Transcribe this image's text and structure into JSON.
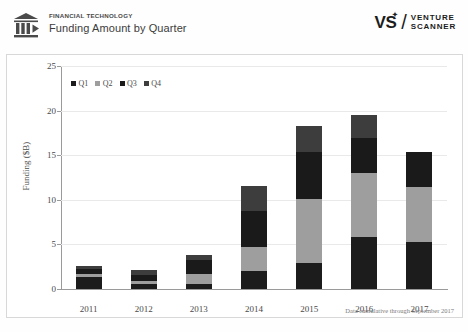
{
  "header": {
    "kicker": "FINANCIAL TECHNOLOGY",
    "title": "Funding Amount by Quarter",
    "logo_icon": "bank-columns-play-icon",
    "brand": {
      "mark": "VS",
      "star": "✦",
      "slash": "/",
      "line1": "VENTURE",
      "line2": "SCANNER"
    }
  },
  "footnote": "Data cumulative through September 2017",
  "chart_data": {
    "type": "bar",
    "stacked": true,
    "title": "Funding Amount by Quarter",
    "xlabel": "",
    "ylabel": "Funding ($B)",
    "ylim": [
      0,
      25
    ],
    "yticks": [
      0,
      5,
      10,
      15,
      20,
      25
    ],
    "grid": true,
    "legend_position": "top-left",
    "categories": [
      "2011",
      "2012",
      "2013",
      "2014",
      "2015",
      "2016",
      "2017"
    ],
    "series": [
      {
        "name": "Q1",
        "color": "#1c1c1c",
        "values": [
          1.3,
          0.6,
          0.6,
          2.0,
          2.9,
          5.8,
          5.3
        ]
      },
      {
        "name": "Q2",
        "color": "#9e9e9e",
        "values": [
          0.4,
          0.3,
          1.1,
          2.7,
          7.2,
          7.2,
          6.1
        ]
      },
      {
        "name": "Q3",
        "color": "#1a1a1a",
        "values": [
          0.5,
          0.7,
          1.6,
          4.0,
          5.3,
          3.9,
          4.0
        ]
      },
      {
        "name": "Q4",
        "color": "#3d3d3d",
        "values": [
          0.4,
          0.5,
          0.5,
          2.9,
          2.9,
          2.6,
          0.0
        ]
      }
    ],
    "totals": [
      2.6,
      2.1,
      3.8,
      11.6,
      18.3,
      19.5,
      15.4
    ]
  }
}
